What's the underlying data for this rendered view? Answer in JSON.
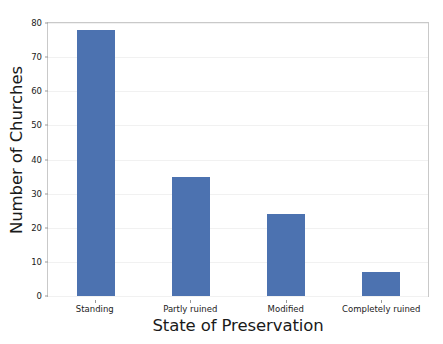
{
  "chart_data": {
    "type": "bar",
    "title": "",
    "xlabel": "State of Preservation",
    "ylabel": "Number of Churches",
    "categories": [
      "Standing",
      "Partly ruined",
      "Modified",
      "Completely ruined"
    ],
    "values": [
      78,
      35,
      24,
      7
    ],
    "ylim": [
      0,
      80
    ],
    "yticks": [
      0,
      10,
      20,
      30,
      40,
      50,
      60,
      70,
      80
    ],
    "ytick_labels": [
      "0",
      "10",
      "20",
      "30",
      "40",
      "50",
      "60",
      "70",
      "80"
    ],
    "grid": "horizontal-faint",
    "legend": "none",
    "bar_color": "#4c72b0",
    "background_color": "#ffffff",
    "spine_color": "#c9c9c9",
    "gridline_color": "#f1f1f1"
  }
}
